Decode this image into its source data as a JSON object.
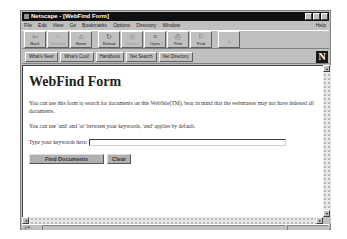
{
  "window": {
    "title": "Netscape - [WebFind Form]"
  },
  "menubar": {
    "items": [
      "File",
      "Edit",
      "View",
      "Go",
      "Bookmarks",
      "Options",
      "Directory",
      "Window"
    ],
    "help": "Help"
  },
  "toolbar": {
    "buttons": [
      {
        "label": "Back",
        "icon": "back-arrow-icon",
        "glyph": "⇦",
        "enabled": true
      },
      {
        "label": "Forward",
        "icon": "forward-arrow-icon",
        "glyph": "⇨",
        "enabled": false
      },
      {
        "label": "Home",
        "icon": "home-icon",
        "glyph": "⌂",
        "enabled": true
      },
      {
        "label": "Reload",
        "icon": "reload-icon",
        "glyph": "↻",
        "enabled": true
      },
      {
        "label": "Images",
        "icon": "images-icon",
        "glyph": "▣",
        "enabled": false
      },
      {
        "label": "Open",
        "icon": "open-icon",
        "glyph": "≡",
        "enabled": true
      },
      {
        "label": "Print",
        "icon": "print-icon",
        "glyph": "⎙",
        "enabled": true
      },
      {
        "label": "Find",
        "icon": "find-icon",
        "glyph": "⚐",
        "enabled": true
      },
      {
        "label": "",
        "icon": "stop-icon",
        "glyph": "●",
        "enabled": false
      }
    ]
  },
  "directory_buttons": [
    "What's New!",
    "What's Cool!",
    "Handbook",
    "Net Search",
    "Net Directory"
  ],
  "logo": "N",
  "page": {
    "heading": "WebFind Form",
    "paragraph1": "You can use this form to search for documents on this WebSite(TM), bear in mind that the webmaster may not have indexed all documents.",
    "paragraph2": "You can use 'and' and 'or' between your keywords, 'and' applies by default.",
    "keyword_label": "Type your keywords here:",
    "keyword_value": "",
    "find_button": "Find Documents",
    "clear_button": "Clear"
  },
  "scrollbars": {
    "up": "▴",
    "down": "▾",
    "left": "◂",
    "right": "▸"
  },
  "statusbar": {
    "icon": "security-key-icon",
    "glyph": "⚷✉",
    "text": ""
  }
}
